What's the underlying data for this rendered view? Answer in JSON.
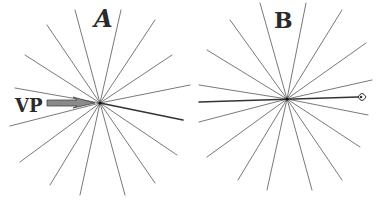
{
  "diagram": {
    "panels": [
      {
        "label": "A",
        "center": [
          100,
          103
        ],
        "rays": [
          [
            75,
            10
          ],
          [
            121,
            10
          ],
          [
            47,
            25
          ],
          [
            155,
            20
          ],
          [
            25,
            55
          ],
          [
            172,
            55
          ],
          [
            15,
            88
          ],
          [
            190,
            85
          ],
          [
            10,
            126
          ],
          [
            20,
            162
          ],
          [
            177,
            155
          ],
          [
            50,
            185
          ],
          [
            155,
            183
          ],
          [
            80,
            195
          ],
          [
            125,
            195
          ]
        ],
        "bold_ray": [
          183,
          120
        ],
        "pointer": {
          "label": "VP",
          "from": [
            47,
            103
          ],
          "to": [
            95,
            103
          ]
        }
      },
      {
        "label": "B",
        "center": [
          287,
          99
        ],
        "rays": [
          [
            260,
            3
          ],
          [
            306,
            3
          ],
          [
            230,
            20
          ],
          [
            342,
            10
          ],
          [
            207,
            50
          ],
          [
            366,
            43
          ],
          [
            199,
            85
          ],
          [
            372,
            80
          ],
          [
            199,
            122
          ],
          [
            368,
            115
          ],
          [
            207,
            157
          ],
          [
            360,
            147
          ],
          [
            238,
            180
          ],
          [
            342,
            180
          ],
          [
            267,
            190
          ],
          [
            312,
            190
          ]
        ],
        "horizon": {
          "from": [
            199,
            102
          ],
          "to": [
            358,
            97
          ]
        },
        "eye_icon": "eye-icon"
      }
    ],
    "colors": {
      "line": "#6a6a6a",
      "ink": "#2a2a2a",
      "arrow": "#8a8a8a"
    }
  }
}
